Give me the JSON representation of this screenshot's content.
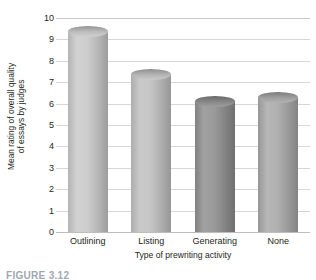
{
  "chart_data": {
    "type": "bar",
    "title": "",
    "xlabel": "Type of prewriting activity",
    "ylabel_line1": "Mean rating of overall quality",
    "ylabel_line2": "of essays by judges",
    "categories": [
      "Outlining",
      "Listing",
      "Generating",
      "None"
    ],
    "values": [
      9.4,
      7.4,
      6.1,
      6.3
    ],
    "yticks": [
      10,
      9,
      8,
      7,
      6,
      5,
      4,
      3,
      2,
      1,
      0
    ],
    "ylim": [
      0,
      10
    ],
    "grid": true,
    "legend": "none",
    "bar_style": "cylinder",
    "bar_colors": [
      "#c8c8c8",
      "#c0c0c0",
      "#8f8f8f",
      "#a8a8a8"
    ],
    "grid_color": "#d7d7d7",
    "text_color": "#231f20"
  },
  "caption": {
    "text": "FIGURE 3.12"
  }
}
